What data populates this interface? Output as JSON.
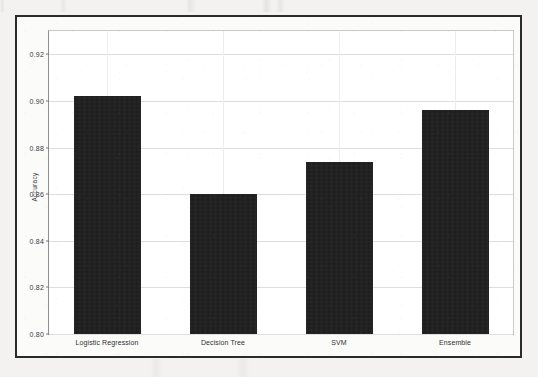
{
  "figure": {
    "background_color": "#fbfbfa",
    "page_color": "#f3f2f0",
    "frame_color": "#2b2b2b",
    "bar_color": "#1b1b1b",
    "grid_color": "#dedede"
  },
  "chart_data": {
    "type": "bar",
    "title": "",
    "xlabel": "",
    "ylabel": "Accuracy",
    "categories": [
      "Logistic Regression",
      "Decision Tree",
      "SVM",
      "Ensemble"
    ],
    "values": [
      0.902,
      0.86,
      0.874,
      0.896
    ],
    "ylim": [
      0.8,
      0.93
    ],
    "yticks": [
      0.8,
      0.82,
      0.84,
      0.86,
      0.88,
      0.9,
      0.92
    ],
    "ytick_labels": [
      "0.80",
      "0.82",
      "0.84",
      "0.86",
      "0.88",
      "0.90",
      "0.92"
    ],
    "grid": true,
    "grid_axis": "both",
    "legend": false,
    "legend_position": "none",
    "series": [
      {
        "name": "Accuracy",
        "color": "#1b1b1b",
        "values": [
          0.902,
          0.86,
          0.874,
          0.896
        ]
      }
    ]
  }
}
